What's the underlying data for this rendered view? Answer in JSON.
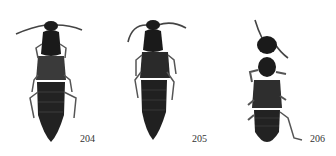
{
  "figure": {
    "specimens": [
      {
        "id": "specimen-204",
        "label": "204"
      },
      {
        "id": "specimen-205",
        "label": "205"
      },
      {
        "id": "specimen-206",
        "label": "206"
      }
    ],
    "colors": {
      "background": "#ffffff",
      "body_dark": "#1a1a1a",
      "body_mid": "#3a3a3a",
      "appendage": "#555555",
      "label_text": "#333333"
    }
  }
}
